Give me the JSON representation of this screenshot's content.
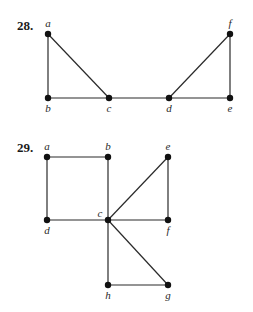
{
  "figures": [
    {
      "number": "28.",
      "number_pos": [
        17,
        30
      ],
      "nodes": [
        {
          "id": "a",
          "x": 48,
          "y": 34,
          "lx": 48,
          "ly": 27,
          "anchor": "middle"
        },
        {
          "id": "b",
          "x": 48,
          "y": 98,
          "lx": 48,
          "ly": 112,
          "anchor": "middle"
        },
        {
          "id": "c",
          "x": 109,
          "y": 98,
          "lx": 109,
          "ly": 112,
          "anchor": "middle"
        },
        {
          "id": "d",
          "x": 169,
          "y": 98,
          "lx": 169,
          "ly": 112,
          "anchor": "middle"
        },
        {
          "id": "e",
          "x": 230,
          "y": 98,
          "lx": 230,
          "ly": 112,
          "anchor": "middle"
        },
        {
          "id": "f",
          "x": 230,
          "y": 34,
          "lx": 230,
          "ly": 27,
          "anchor": "middle"
        }
      ],
      "edges": [
        [
          "a",
          "b"
        ],
        [
          "a",
          "c"
        ],
        [
          "b",
          "c"
        ],
        [
          "c",
          "d"
        ],
        [
          "d",
          "e"
        ],
        [
          "d",
          "f"
        ],
        [
          "e",
          "f"
        ]
      ]
    },
    {
      "number": "29.",
      "number_pos": [
        17,
        152
      ],
      "nodes": [
        {
          "id": "a",
          "x": 47,
          "y": 157,
          "lx": 47,
          "ly": 150,
          "anchor": "middle"
        },
        {
          "id": "b",
          "x": 108,
          "y": 157,
          "lx": 108,
          "ly": 150,
          "anchor": "middle"
        },
        {
          "id": "e",
          "x": 168,
          "y": 157,
          "lx": 168,
          "ly": 150,
          "anchor": "middle"
        },
        {
          "id": "c",
          "x": 108,
          "y": 220,
          "lx": 100,
          "ly": 217,
          "anchor": "middle"
        },
        {
          "id": "d",
          "x": 47,
          "y": 220,
          "lx": 47,
          "ly": 234,
          "anchor": "middle"
        },
        {
          "id": "f",
          "x": 168,
          "y": 220,
          "lx": 168,
          "ly": 234,
          "anchor": "middle"
        },
        {
          "id": "h",
          "x": 108,
          "y": 285,
          "lx": 108,
          "ly": 299,
          "anchor": "middle"
        },
        {
          "id": "g",
          "x": 168,
          "y": 285,
          "lx": 168,
          "ly": 299,
          "anchor": "middle"
        }
      ],
      "edges": [
        [
          "a",
          "b"
        ],
        [
          "a",
          "d"
        ],
        [
          "b",
          "c"
        ],
        [
          "d",
          "c"
        ],
        [
          "c",
          "e"
        ],
        [
          "c",
          "f"
        ],
        [
          "e",
          "f"
        ],
        [
          "c",
          "h"
        ],
        [
          "c",
          "g"
        ],
        [
          "h",
          "g"
        ]
      ]
    }
  ]
}
